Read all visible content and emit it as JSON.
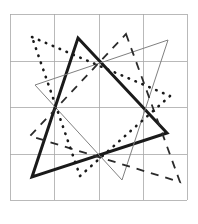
{
  "figure": {
    "title": "",
    "background_color": "#ffffff",
    "width": 198,
    "height": 224
  },
  "chart_data": {
    "type": "scatter",
    "title": "",
    "subtitle": "",
    "xlabel": "",
    "ylabel": "",
    "grid": true,
    "legend": null,
    "legend_position": "none",
    "xlim": [
      0,
      4
    ],
    "ylim": [
      0,
      4
    ],
    "xticks": [
      0,
      1,
      2,
      3,
      4
    ],
    "yticks": [
      0,
      4,
      3,
      2,
      1,
      0
    ],
    "xticklabels": [
      "",
      "",
      "",
      "",
      ""
    ],
    "yticklabels": [
      "",
      "",
      "",
      "",
      ""
    ],
    "plot_box": {
      "left": 10,
      "top": 14,
      "right": 187,
      "bottom": 200
    },
    "grid_lines": {
      "color": "#a8a8a8",
      "width": 0.8,
      "vertical_x": [
        10,
        54,
        99,
        143,
        187
      ],
      "horizontal_y": [
        14,
        61,
        107,
        154,
        200
      ]
    },
    "series": [
      {
        "name": "triangle-bold",
        "style": "solid",
        "linestyle": "solid",
        "color": "#1a1a1a",
        "linewidth": 3.0,
        "dasharray": "",
        "closed": true,
        "points": [
          [
            78,
            38
          ],
          [
            167,
            133
          ],
          [
            32,
            177
          ]
        ]
      },
      {
        "name": "triangle-thin",
        "style": "solid",
        "linestyle": "solid",
        "color": "#808080",
        "linewidth": 1.0,
        "dasharray": "",
        "closed": true,
        "points": [
          [
            35,
            85
          ],
          [
            168,
            40
          ],
          [
            122,
            180
          ]
        ]
      },
      {
        "name": "triangle-dashed",
        "style": "dashed",
        "linestyle": "dashed",
        "color": "#2b2b2b",
        "linewidth": 1.8,
        "dasharray": "8 7",
        "closed": true,
        "points": [
          [
            126,
            34
          ],
          [
            180,
            182
          ],
          [
            30,
            136
          ]
        ]
      },
      {
        "name": "triangle-dotted",
        "style": "dotted",
        "linestyle": "dotted",
        "color": "#1a1a1a",
        "linewidth": 2.6,
        "dasharray": "0.5 7",
        "closed": true,
        "points": [
          [
            32,
            37
          ],
          [
            170,
            96
          ],
          [
            80,
            176
          ]
        ]
      }
    ]
  }
}
